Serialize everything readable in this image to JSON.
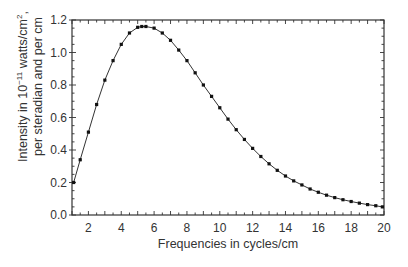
{
  "chart_data": {
    "type": "line",
    "title": "",
    "xlabel": "Frequencies in cycles/cm",
    "ylabel_line1": "Intensity in 10^-11 watts/cm^2,",
    "ylabel_line2": "per steradian and per cm",
    "xlim": [
      1,
      20
    ],
    "ylim": [
      0,
      1.2
    ],
    "xticks": [
      2,
      4,
      6,
      8,
      10,
      12,
      14,
      16,
      18,
      20
    ],
    "yticks": [
      0.0,
      0.2,
      0.4,
      0.6,
      0.8,
      1.0,
      1.2
    ],
    "ytick_labels": [
      "0.0",
      "0.2",
      "0.4",
      "0.6",
      "0.8",
      "1.0",
      "1.2"
    ],
    "grid": false,
    "legend": null,
    "series": [
      {
        "name": "Cosmic background radiation spectrum",
        "marker": "square",
        "x": [
          1.1,
          1.5,
          2.0,
          2.5,
          3.0,
          3.5,
          4.0,
          4.5,
          5.0,
          5.25,
          5.5,
          6.0,
          6.5,
          7.0,
          7.5,
          8.0,
          8.5,
          9.0,
          9.5,
          10.0,
          10.5,
          11.0,
          11.5,
          12.0,
          12.5,
          13.0,
          13.5,
          14.0,
          14.5,
          15.0,
          15.5,
          16.0,
          16.5,
          17.0,
          17.5,
          18.0,
          18.5,
          19.0,
          19.5,
          19.9
        ],
        "y": [
          0.2,
          0.34,
          0.51,
          0.68,
          0.83,
          0.95,
          1.05,
          1.12,
          1.155,
          1.16,
          1.16,
          1.15,
          1.12,
          1.075,
          1.015,
          0.95,
          0.875,
          0.8,
          0.73,
          0.66,
          0.59,
          0.525,
          0.465,
          0.41,
          0.36,
          0.315,
          0.275,
          0.24,
          0.21,
          0.185,
          0.16,
          0.14,
          0.122,
          0.107,
          0.094,
          0.083,
          0.073,
          0.064,
          0.057,
          0.05
        ]
      }
    ]
  },
  "labels": {
    "ylabel_pre": "Intensity in 10",
    "ylabel_exp": "−11",
    "ylabel_mid": " watts/cm",
    "ylabel_exp2": "2",
    "ylabel_post": ",",
    "ylabel_line2": "per steradian and per cm",
    "xlabel": "Frequencies in cycles/cm"
  }
}
